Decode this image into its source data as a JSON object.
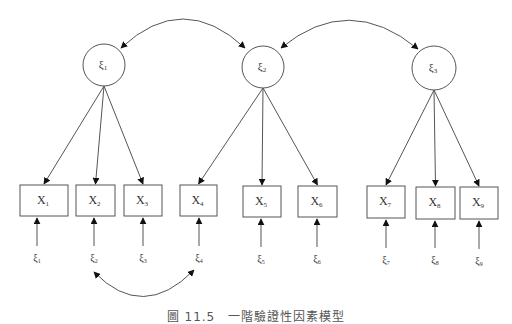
{
  "diagram": {
    "type": "confirmatory-factor-analysis-path-diagram",
    "colors": {
      "stroke": "#555555",
      "text": "#333333",
      "background": "#ffffff"
    },
    "latent_factors": [
      {
        "id": "F1",
        "label": "ξ",
        "sub": "1",
        "cx": 104,
        "cy": 65,
        "r": 21
      },
      {
        "id": "F2",
        "label": "ξ",
        "sub": "2",
        "cx": 263,
        "cy": 67,
        "r": 21
      },
      {
        "id": "F3",
        "label": "ξ",
        "sub": "3",
        "cx": 434,
        "cy": 68,
        "r": 22
      }
    ],
    "indicators": [
      {
        "id": "X1",
        "label": "X",
        "sub": "1",
        "x": 20,
        "y": 185,
        "w": 48,
        "h": 31,
        "factor": "F1"
      },
      {
        "id": "X2",
        "label": "X",
        "sub": "2",
        "x": 76,
        "y": 185,
        "w": 39,
        "h": 31,
        "factor": "F1"
      },
      {
        "id": "X3",
        "label": "X",
        "sub": "3",
        "x": 124,
        "y": 185,
        "w": 38,
        "h": 31,
        "factor": "F1"
      },
      {
        "id": "X4",
        "label": "X",
        "sub": "4",
        "x": 180,
        "y": 185,
        "w": 37,
        "h": 31,
        "factor": "F2"
      },
      {
        "id": "X5",
        "label": "X",
        "sub": "5",
        "x": 243,
        "y": 186,
        "w": 38,
        "h": 31,
        "factor": "F2"
      },
      {
        "id": "X6",
        "label": "X",
        "sub": "6",
        "x": 298,
        "y": 186,
        "w": 39,
        "h": 31,
        "factor": "F2"
      },
      {
        "id": "X7",
        "label": "X",
        "sub": "7",
        "x": 367,
        "y": 186,
        "w": 38,
        "h": 32,
        "factor": "F3"
      },
      {
        "id": "X8",
        "label": "X",
        "sub": "8",
        "x": 416,
        "y": 187,
        "w": 39,
        "h": 32,
        "factor": "F3"
      },
      {
        "id": "X9",
        "label": "X",
        "sub": "9",
        "x": 460,
        "y": 187,
        "w": 38,
        "h": 32,
        "factor": "F3"
      }
    ],
    "error_terms": [
      {
        "label": "ξ",
        "sub": "1",
        "x": 37,
        "y": 258
      },
      {
        "label": "ξ",
        "sub": "2",
        "x": 94,
        "y": 258
      },
      {
        "label": "ξ",
        "sub": "3",
        "x": 143,
        "y": 258
      },
      {
        "label": "ξ",
        "sub": "4",
        "x": 199,
        "y": 258
      },
      {
        "label": "ξ",
        "sub": "5",
        "x": 261,
        "y": 259
      },
      {
        "label": "ξ",
        "sub": "6",
        "x": 317,
        "y": 259
      },
      {
        "label": "ξ",
        "sub": "7",
        "x": 386,
        "y": 260
      },
      {
        "label": "ξ",
        "sub": "8",
        "x": 435,
        "y": 260
      },
      {
        "label": "ξ",
        "sub": "9",
        "x": 479,
        "y": 261
      }
    ],
    "factor_covariances": [
      {
        "from": "F1",
        "to": "F2",
        "path": "M121,48 Q183,-10 245,48"
      },
      {
        "from": "F2",
        "to": "F3",
        "path": "M281,48 Q349,-8 418,49"
      }
    ],
    "error_covariances": [
      {
        "from": "e2",
        "to": "e4",
        "path": "M94,272 Q143,322 194,270"
      }
    ],
    "caption": "圖 11.5　一階驗證性因素模型"
  }
}
